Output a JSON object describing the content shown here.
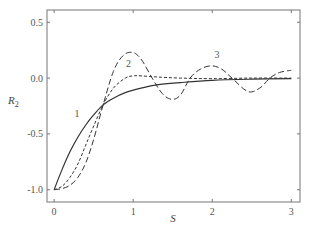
{
  "chart_data": {
    "type": "line",
    "title": "",
    "xlabel": "S",
    "ylabel": "R",
    "ylabel_subscript": "2",
    "xlim": [
      -0.09,
      3.11
    ],
    "ylim": [
      -1.11,
      0.61
    ],
    "xticks": [
      0,
      1,
      2,
      3
    ],
    "xtick_labels": [
      "0",
      "1",
      "2",
      "3"
    ],
    "yticks": [
      0.5,
      0.0,
      -0.5,
      -1.0
    ],
    "ytick_labels": [
      "0.5",
      "0.0",
      "-0.5",
      "-1.0"
    ],
    "grid": false,
    "legend": "none (curves labeled inline)",
    "series": [
      {
        "name": "1",
        "style": "solid",
        "x": [
          0,
          0.1,
          0.2,
          0.3,
          0.4,
          0.5,
          0.62,
          0.75,
          0.9,
          1.1,
          1.3,
          1.6,
          2.0,
          2.5,
          3.0
        ],
        "y": [
          -1.0,
          -0.82,
          -0.66,
          -0.53,
          -0.42,
          -0.33,
          -0.24,
          -0.18,
          -0.13,
          -0.09,
          -0.06,
          -0.04,
          -0.02,
          -0.01,
          -0.005
        ]
      },
      {
        "name": "2",
        "style": "short-dash",
        "x": [
          0,
          0.1,
          0.2,
          0.3,
          0.4,
          0.5,
          0.62,
          0.75,
          0.9,
          1.0,
          1.1,
          1.3,
          1.6,
          2.0,
          2.5,
          3.0
        ],
        "y": [
          -1.0,
          -0.97,
          -0.89,
          -0.77,
          -0.6,
          -0.43,
          -0.24,
          -0.09,
          0.0,
          0.02,
          0.02,
          0.01,
          0.0,
          -0.005,
          0.0,
          0.0
        ]
      },
      {
        "name": "3",
        "style": "long-dash",
        "x": [
          0,
          0.1,
          0.2,
          0.3,
          0.4,
          0.5,
          0.62,
          0.75,
          0.87,
          0.99,
          1.1,
          1.24,
          1.37,
          1.49,
          1.6,
          1.72,
          1.85,
          1.99,
          2.12,
          2.25,
          2.45,
          2.6,
          2.73,
          2.85,
          3.0
        ],
        "y": [
          -1.0,
          -0.99,
          -0.96,
          -0.89,
          -0.76,
          -0.55,
          -0.24,
          0.06,
          0.2,
          0.23,
          0.17,
          0.0,
          -0.14,
          -0.19,
          -0.15,
          0.0,
          0.08,
          0.11,
          0.08,
          0.0,
          -0.12,
          -0.09,
          0.0,
          0.05,
          0.07
        ]
      }
    ],
    "annotations": [
      {
        "text": "1",
        "x": 0.29,
        "y": -0.35
      },
      {
        "text": "2",
        "x": 0.94,
        "y": 0.1
      },
      {
        "text": "3",
        "x": 2.06,
        "y": 0.18
      }
    ]
  }
}
